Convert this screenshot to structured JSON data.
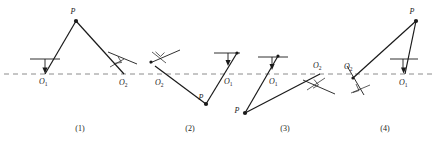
{
  "figure": {
    "axis_line_label": "principal-axis-dashed-line",
    "colors": {
      "ink": "#1a1a1a",
      "dashed_axis": "#8c8c8c",
      "background": "#ffffff"
    },
    "axis_y": 74,
    "panels": [
      {
        "id": "panel-1",
        "caption": "(1)",
        "caption_x": 80,
        "caption_y": 131,
        "point_P": {
          "label": "P",
          "x": 76,
          "y": 21,
          "label_x": 73,
          "label_y": 13
        },
        "mirror_O1": {
          "label": "O",
          "subscript": "1",
          "x": 45,
          "y": 74,
          "label_x": 39,
          "label_y": 83,
          "surface": "horizontal",
          "surface_x1": 30,
          "surface_y1": 59,
          "surface_x2": 60,
          "surface_y2": 59,
          "normal_x1": 45,
          "normal_y1": 59,
          "normal_x2": 45,
          "normal_y2": 71,
          "arrow": "down"
        },
        "mirror_O2": {
          "label": "O",
          "subscript": "2",
          "x": 124,
          "y": 74,
          "label_x": 120,
          "label_y": 84,
          "surface": "tilted",
          "surface_x1": 108,
          "surface_y1": 52,
          "surface_x2": 136,
          "surface_y2": 64,
          "tick_x1": 112,
          "tick_y1": 66,
          "tick_x2": 126,
          "tick_y2": 58,
          "angle_mark": true
        },
        "rays": [
          {
            "name": "incident-ray",
            "x1": 45,
            "y1": 74,
            "x2": 76,
            "y2": 21
          },
          {
            "name": "reflected-ray",
            "x1": 76,
            "y1": 21,
            "x2": 124,
            "y2": 74
          }
        ]
      },
      {
        "id": "panel-2",
        "caption": "(2)",
        "caption_x": 190,
        "caption_y": 131,
        "point_P": {
          "label": "P",
          "x": 206,
          "y": 104,
          "label_x": 201,
          "label_y": 99
        },
        "mirror_O1": {
          "label": "O",
          "subscript": "1",
          "x": 222,
          "y": 74,
          "label_x": 224,
          "label_y": 83,
          "surface": "horizontal",
          "surface_x1": 214,
          "surface_y1": 53,
          "surface_x2": 240,
          "surface_y2": 53,
          "normal_x1": 228,
          "normal_y1": 53,
          "normal_x2": 228,
          "normal_y2": 64,
          "arrow": "down"
        },
        "mirror_O2": {
          "label": "O",
          "subscript": "2",
          "x": 160,
          "y": 74,
          "label_x": 156,
          "label_y": 84,
          "surface": "tilted",
          "surface_x1": 150,
          "surface_y1": 63,
          "surface_x2": 180,
          "surface_y2": 50,
          "tick_x1": 152,
          "tick_y1": 52,
          "tick_x2": 166,
          "tick_y2": 62,
          "angle_mark": true
        },
        "rays": [
          {
            "name": "incident-ray",
            "x1": 160,
            "y1": 74,
            "x2": 206,
            "y2": 104
          },
          {
            "name": "reflected-ray",
            "x1": 206,
            "y1": 104,
            "x2": 237,
            "y2": 53
          }
        ]
      },
      {
        "id": "panel-3",
        "caption": "(3)",
        "caption_x": 285,
        "caption_y": 131,
        "point_P": {
          "label": "P",
          "x": 245,
          "y": 113,
          "label_x": 237,
          "label_y": 111
        },
        "mirror_O1": {
          "label": "O",
          "subscript": "1",
          "x": 268,
          "y": 74,
          "label_x": 270,
          "label_y": 83,
          "surface": "horizontal",
          "surface_x1": 258,
          "surface_y1": 57,
          "surface_x2": 288,
          "surface_y2": 57,
          "normal_x1": 274,
          "normal_y1": 57,
          "normal_x2": 274,
          "normal_y2": 68,
          "arrow": "down"
        },
        "mirror_O2": {
          "label": "O",
          "subscript": "2",
          "x": 320,
          "y": 74,
          "label_x": 316,
          "label_y": 67,
          "surface": "tilted",
          "surface_x1": 304,
          "surface_y1": 80,
          "surface_x2": 334,
          "surface_y2": 94,
          "tick_x1": 308,
          "tick_y1": 90,
          "tick_x2": 324,
          "tick_y2": 79,
          "angle_mark": true
        },
        "rays": [
          {
            "name": "incident-ray",
            "x1": 245,
            "y1": 113,
            "x2": 277,
            "y2": 55
          },
          {
            "name": "reflected-ray",
            "x1": 245,
            "y1": 113,
            "x2": 320,
            "y2": 74
          }
        ]
      },
      {
        "id": "panel-4",
        "caption": "(4)",
        "caption_x": 385,
        "caption_y": 131,
        "point_P": {
          "label": "P",
          "x": 416,
          "y": 21,
          "label_x": 412,
          "label_y": 13
        },
        "mirror_O1": {
          "label": "O",
          "subscript": "1",
          "x": 406,
          "y": 74,
          "label_x": 402,
          "label_y": 84,
          "surface": "horizontal",
          "surface_x1": 390,
          "surface_y1": 59,
          "surface_x2": 418,
          "surface_y2": 59,
          "normal_x1": 404,
          "normal_y1": 59,
          "normal_x2": 404,
          "normal_y2": 71,
          "arrow": "down"
        },
        "mirror_O2": {
          "label": "O",
          "subscript": "2",
          "x": 354,
          "y": 74,
          "label_x": 346,
          "label_y": 68,
          "surface": "tilted",
          "surface_x1": 346,
          "surface_y1": 64,
          "surface_x2": 364,
          "surface_y2": 94,
          "tick_x1": 350,
          "tick_y1": 92,
          "tick_x2": 368,
          "tick_y2": 84,
          "angle_mark": true
        },
        "rays": [
          {
            "name": "incident-ray",
            "x1": 354,
            "y1": 74,
            "x2": 416,
            "y2": 21
          },
          {
            "name": "reflected-ray",
            "x1": 416,
            "y1": 21,
            "x2": 406,
            "y2": 74
          }
        ]
      }
    ]
  }
}
